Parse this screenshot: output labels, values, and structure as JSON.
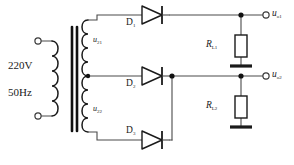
{
  "diagram": {
    "colors": {
      "wire": "#4a4a4a",
      "device": "#1a1a1a",
      "background": "#ffffff",
      "text": "#1a1a1a"
    },
    "source": {
      "voltage": "220V",
      "frequency": "50Hz"
    },
    "windings": [
      {
        "name": "u",
        "sub": "21",
        "position": "secondary-top"
      },
      {
        "name": "u",
        "sub": "22",
        "position": "secondary-bottom"
      }
    ],
    "diodes": [
      {
        "name": "D",
        "sub": "1",
        "position": "top-branch"
      },
      {
        "name": "D",
        "sub": "2",
        "position": "middle-branch"
      },
      {
        "name": "D",
        "sub": "3",
        "position": "bottom-branch"
      }
    ],
    "resistors": [
      {
        "name": "R",
        "sub": "L1",
        "position": "top-load"
      },
      {
        "name": "R",
        "sub": "L2",
        "position": "bottom-load"
      }
    ],
    "outputs": [
      {
        "name": "u",
        "sub": "o1",
        "position": "top-right-terminal"
      },
      {
        "name": "u",
        "sub": "o2",
        "position": "bottom-right-terminal"
      }
    ]
  }
}
